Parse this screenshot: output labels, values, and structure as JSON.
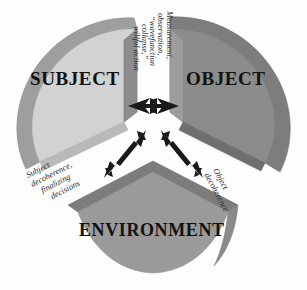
{
  "diagram": {
    "background_color": "#fdfdfd",
    "wedges": [
      {
        "id": "subject",
        "label": "SUBJECT",
        "face_color": "#d2d2d2",
        "side_color": "#8d8d8d",
        "rim_color": "#9a9a9a",
        "position": "upper-left"
      },
      {
        "id": "object",
        "label": "OBJECT",
        "face_color": "#8c8c8c",
        "side_color": "#6f6f6f",
        "rim_color": "#7d7d7d",
        "position": "upper-right"
      },
      {
        "id": "environment",
        "label": "ENVIRONMENT",
        "face_color": "#9a9a9a",
        "side_color": "#7c7c7c",
        "rim_color": "#8a8a8a",
        "position": "bottom"
      }
    ],
    "annotations": [
      {
        "id": "measurement",
        "between": [
          "subject",
          "object"
        ],
        "orientation": "vertical",
        "lines": [
          "Measurement,",
          "observation,",
          "“wavefunction",
          "collapse,”",
          "willful action"
        ]
      },
      {
        "id": "subject-decoherence",
        "between": [
          "subject",
          "environment"
        ],
        "orientation": "diagonal-left",
        "lines": [
          "Subject",
          "decoherence,",
          "finalizing",
          "decisions"
        ]
      },
      {
        "id": "object-decoherence",
        "between": [
          "object",
          "environment"
        ],
        "orientation": "diagonal-right",
        "lines": [
          "Object",
          "decoherence"
        ]
      }
    ],
    "arrows": [
      {
        "id": "subject-object-arrow",
        "from": "subject",
        "to": "object",
        "style": "double-headed-barbed",
        "direction": "horizontal",
        "color": "#1a1a1a"
      },
      {
        "id": "subject-environment-arrow",
        "from": "subject",
        "to": "environment",
        "style": "double-headed-barbed",
        "direction": "diagonal-down-left",
        "color": "#1a1a1a"
      },
      {
        "id": "object-environment-arrow",
        "from": "object",
        "to": "environment",
        "style": "double-headed-barbed",
        "direction": "diagonal-down-right",
        "color": "#1a1a1a"
      }
    ]
  }
}
